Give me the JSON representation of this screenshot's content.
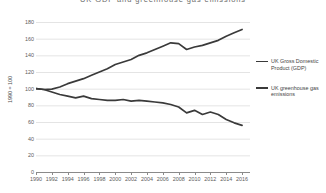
{
  "chart_data": {
    "type": "line",
    "title": "UK GDP and greenhouse gas emissions",
    "xlabel": "",
    "ylabel": "1990 = 100",
    "xlim": [
      1990,
      2017
    ],
    "ylim": [
      0,
      180
    ],
    "grid": true,
    "legend_position": "right",
    "x": [
      1990,
      1991,
      1992,
      1993,
      1994,
      1995,
      1996,
      1997,
      1998,
      1999,
      2000,
      2001,
      2002,
      2003,
      2004,
      2005,
      2006,
      2007,
      2008,
      2009,
      2010,
      2011,
      2012,
      2013,
      2014,
      2015,
      2016
    ],
    "xticks": [
      1990,
      1992,
      1994,
      1996,
      1998,
      2000,
      2002,
      2004,
      2006,
      2008,
      2010,
      2012,
      2014,
      2016
    ],
    "yticks": [
      0,
      20,
      40,
      60,
      80,
      100,
      120,
      140,
      160,
      180
    ],
    "series": [
      {
        "name": "UK Gross Domestic Product (GDP)",
        "color": "#3a3a3a",
        "values": [
          100,
          99,
          99.5,
          102,
          106,
          109,
          112,
          116,
          120,
          124,
          129,
          132,
          135,
          140,
          143,
          147,
          151,
          155,
          154,
          147,
          150,
          152,
          155,
          158,
          163,
          167,
          171
        ]
      },
      {
        "name": "UK greenhouse gas emissions",
        "color": "#3a3a3a",
        "values": [
          100,
          99,
          96,
          93,
          91,
          89,
          91,
          88,
          87,
          86,
          86,
          87,
          85,
          86,
          85,
          84,
          83,
          81,
          78,
          71,
          74,
          69,
          72,
          69,
          63,
          59,
          56
        ]
      }
    ]
  },
  "legend": {
    "entries": [
      {
        "label": "UK Gross Domestic Product (GDP)"
      },
      {
        "label": "UK greenhouse gas emissions"
      }
    ]
  }
}
